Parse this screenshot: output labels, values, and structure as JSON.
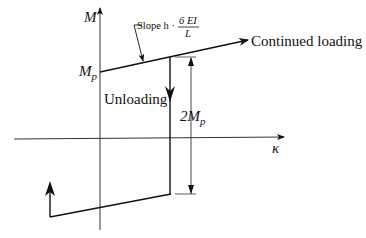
{
  "diagram": {
    "labels": {
      "y_axis": "M",
      "x_axis": "κ",
      "mp_main": "M",
      "mp_sub": "p",
      "slope_prefix": "Slope h ·",
      "slope_numerator": "6 EI",
      "slope_denominator": "L",
      "continued_loading": "Continued loading",
      "unloading": "Unloading",
      "dimension_coef": "2M",
      "dimension_sub": "p"
    },
    "colors": {
      "line": "#111111",
      "axis": "#333333"
    }
  }
}
